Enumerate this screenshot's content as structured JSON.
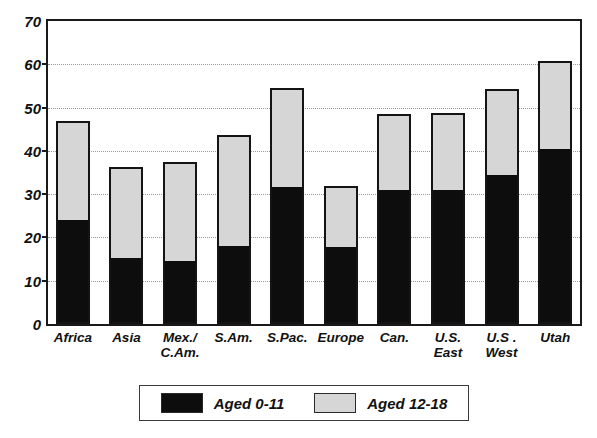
{
  "chart_data": {
    "type": "bar",
    "subtype": "stacked-vertical",
    "title": "",
    "subtitle": "",
    "xlabel": "",
    "ylabel": "",
    "ylim": [
      0,
      70
    ],
    "yticks": [
      0,
      10,
      20,
      30,
      40,
      50,
      60,
      70
    ],
    "ytick_labels": [
      "0",
      "10",
      "20",
      "30",
      "40",
      "50",
      "60",
      "70"
    ],
    "grid": true,
    "grid_axis": "y",
    "grid_style": "dotted",
    "legend_position": "bottom-center",
    "categories": [
      "Africa",
      "Asia",
      "Mex./\nC.Am.",
      "S.Am.",
      "S.Pac.",
      "Europe",
      "Can.",
      "U.S.\nEast",
      "U.S .\nWest",
      "Utah"
    ],
    "series": [
      {
        "name": "Aged 0-11",
        "color": "#0d0d0d",
        "values": [
          23.5,
          14.8,
          14.0,
          17.6,
          31.2,
          17.4,
          30.4,
          30.4,
          33.9,
          40.0
        ]
      },
      {
        "name": "Aged 12-18",
        "color": "#d6d6d6",
        "values": [
          23.3,
          21.4,
          23.4,
          26.0,
          23.3,
          14.6,
          18.1,
          18.4,
          20.5,
          20.8
        ]
      }
    ],
    "totals": [
      46.8,
      36.2,
      37.4,
      43.6,
      54.5,
      32.0,
      48.5,
      48.8,
      54.4,
      60.8
    ]
  },
  "legend": {
    "entries": [
      {
        "label": "Aged 0-11",
        "swatch": "dark-swatch-icon"
      },
      {
        "label": "Aged 12-18",
        "swatch": "light-swatch-icon"
      }
    ]
  },
  "colors": {
    "aged_0_11": "#0d0d0d",
    "aged_12_18": "#d6d6d6",
    "axis": "#1a1a1a",
    "grid": "#9a9a9a",
    "background": "#ffffff"
  }
}
